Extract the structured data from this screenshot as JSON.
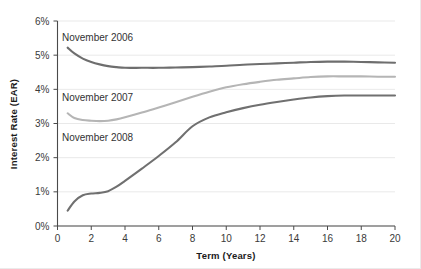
{
  "chart_data": {
    "type": "line",
    "title": "",
    "xlabel": "Term (Years)",
    "ylabel": "Interest Rate (EAR)",
    "xlim": [
      0,
      20
    ],
    "ylim": [
      0,
      6
    ],
    "xticks": [
      "0",
      "2",
      "4",
      "6",
      "8",
      "10",
      "12",
      "14",
      "16",
      "18",
      "20"
    ],
    "yticks": [
      "0%",
      "1%",
      "2%",
      "3%",
      "4%",
      "5%",
      "6%"
    ],
    "grid": true,
    "legend_position": "inline-annotations",
    "x": [
      0.6,
      1,
      1.5,
      2,
      2.5,
      3,
      3.5,
      4,
      5,
      6,
      7,
      8,
      9,
      10,
      11,
      12,
      13,
      14,
      15,
      16,
      17,
      18,
      19,
      20
    ],
    "series": [
      {
        "name": "November 2006",
        "color": "#6e6e6e",
        "values": [
          5.22,
          5.05,
          4.9,
          4.8,
          4.73,
          4.68,
          4.65,
          4.63,
          4.63,
          4.63,
          4.64,
          4.65,
          4.67,
          4.69,
          4.72,
          4.74,
          4.76,
          4.78,
          4.8,
          4.81,
          4.81,
          4.8,
          4.79,
          4.78
        ]
      },
      {
        "name": "November 2007",
        "color": "#b5b5b5",
        "values": [
          3.3,
          3.16,
          3.1,
          3.08,
          3.07,
          3.08,
          3.12,
          3.18,
          3.32,
          3.47,
          3.62,
          3.78,
          3.93,
          4.06,
          4.15,
          4.22,
          4.28,
          4.32,
          4.36,
          4.38,
          4.38,
          4.38,
          4.37,
          4.37
        ]
      },
      {
        "name": "November 2008",
        "color": "#707070",
        "values": [
          0.45,
          0.72,
          0.9,
          0.95,
          0.97,
          1.02,
          1.15,
          1.32,
          1.68,
          2.05,
          2.45,
          2.92,
          3.18,
          3.33,
          3.45,
          3.55,
          3.63,
          3.7,
          3.76,
          3.8,
          3.82,
          3.82,
          3.82,
          3.82
        ]
      }
    ],
    "annotations": [
      {
        "text": "November 2006",
        "x_px": 62,
        "y_px": 41
      },
      {
        "text": "November 2007",
        "x_px": 62,
        "y_px": 101
      },
      {
        "text": "November 2008",
        "x_px": 62,
        "y_px": 141
      }
    ]
  }
}
